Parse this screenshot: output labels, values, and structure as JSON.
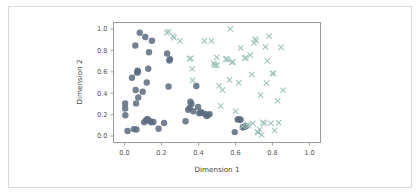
{
  "figure": {
    "background_color": "#ffffff",
    "border_color": "#d8d8d8",
    "axes_spine_color": "#9a9a9a"
  },
  "chart_data": {
    "type": "scatter",
    "title": "",
    "xlabel": "Dimension 1",
    "ylabel": "Dimension 2",
    "xlim": [
      -0.06,
      1.06
    ],
    "ylim": [
      -0.06,
      1.06
    ],
    "xticks": [
      0.0,
      0.2,
      0.4,
      0.6,
      0.8,
      1.0
    ],
    "yticks": [
      0.0,
      0.2,
      0.4,
      0.6,
      0.8,
      1.0
    ],
    "xtick_labels": [
      "0.0",
      "0.2",
      "0.4",
      "0.6",
      "0.8",
      "1.0"
    ],
    "ytick_labels": [
      "0.0",
      "0.2",
      "0.4",
      "0.6",
      "0.8",
      "1.0"
    ],
    "grid": false,
    "legend": false,
    "legend_position": "none",
    "series": [
      {
        "name": "cluster-circles",
        "marker": "o",
        "color": "#5b6b80",
        "marker_size": 4.2,
        "points": [
          [
            0.003,
            0.305
          ],
          [
            0.003,
            0.258
          ],
          [
            0.004,
            0.195
          ],
          [
            0.016,
            0.048
          ],
          [
            0.04,
            0.545
          ],
          [
            0.05,
            0.065
          ],
          [
            0.058,
            0.845
          ],
          [
            0.06,
            0.43
          ],
          [
            0.062,
            0.305
          ],
          [
            0.064,
            0.062
          ],
          [
            0.068,
            0.592
          ],
          [
            0.07,
            0.61
          ],
          [
            0.072,
            0.6
          ],
          [
            0.074,
            0.36
          ],
          [
            0.082,
            0.965
          ],
          [
            0.098,
            0.413
          ],
          [
            0.106,
            0.13
          ],
          [
            0.112,
            0.925
          ],
          [
            0.116,
            0.148
          ],
          [
            0.12,
            0.5
          ],
          [
            0.124,
            0.16
          ],
          [
            0.128,
            0.628
          ],
          [
            0.132,
            0.782
          ],
          [
            0.136,
            0.142
          ],
          [
            0.144,
            0.128
          ],
          [
            0.148,
            0.89
          ],
          [
            0.156,
            0.132
          ],
          [
            0.184,
            0.068
          ],
          [
            0.214,
            0.122
          ],
          [
            0.23,
            0.77
          ],
          [
            0.238,
            0.462
          ],
          [
            0.242,
            0.705
          ],
          [
            0.246,
            0.718
          ],
          [
            0.33,
            0.138
          ],
          [
            0.344,
            0.245
          ],
          [
            0.352,
            0.262
          ],
          [
            0.356,
            0.32
          ],
          [
            0.362,
            0.3
          ],
          [
            0.372,
            0.232
          ],
          [
            0.388,
            0.468
          ],
          [
            0.398,
            0.272
          ],
          [
            0.404,
            0.212
          ],
          [
            0.412,
            0.222
          ],
          [
            0.418,
            0.218
          ],
          [
            0.436,
            0.206
          ],
          [
            0.444,
            0.188
          ],
          [
            0.452,
            0.196
          ],
          [
            0.46,
            0.205
          ],
          [
            0.596,
            0.037
          ],
          [
            0.612,
            0.155
          ],
          [
            0.62,
            0.157
          ],
          [
            0.628,
            0.152
          ],
          [
            0.64,
            0.08
          ],
          [
            0.648,
            0.088
          ],
          [
            0.656,
            0.092
          ]
        ]
      },
      {
        "name": "cluster-crosses",
        "marker": "x",
        "color": "#9fc4bd",
        "marker_size": 3.6,
        "points": [
          [
            0.228,
            0.965
          ],
          [
            0.238,
            0.975
          ],
          [
            0.262,
            0.932
          ],
          [
            0.268,
            0.918
          ],
          [
            0.3,
            0.888
          ],
          [
            0.352,
            0.72
          ],
          [
            0.358,
            0.726
          ],
          [
            0.366,
            0.628
          ],
          [
            0.368,
            0.52
          ],
          [
            0.432,
            0.888
          ],
          [
            0.47,
            0.888
          ],
          [
            0.482,
            0.678
          ],
          [
            0.486,
            0.66
          ],
          [
            0.492,
            0.668
          ],
          [
            0.498,
            0.735
          ],
          [
            0.5,
            0.66
          ],
          [
            0.512,
            0.47
          ],
          [
            0.52,
            0.282
          ],
          [
            0.53,
            0.43
          ],
          [
            0.548,
            0.718
          ],
          [
            0.552,
            0.722
          ],
          [
            0.56,
            0.712
          ],
          [
            0.568,
            0.524
          ],
          [
            0.572,
            1.0
          ],
          [
            0.58,
            0.688
          ],
          [
            0.586,
            0.692
          ],
          [
            0.6,
            0.232
          ],
          [
            0.618,
            0.498
          ],
          [
            0.628,
            0.822
          ],
          [
            0.638,
            0.092
          ],
          [
            0.65,
            0.726
          ],
          [
            0.656,
            0.732
          ],
          [
            0.664,
            0.108
          ],
          [
            0.672,
            0.098
          ],
          [
            0.68,
            0.755
          ],
          [
            0.688,
            0.575
          ],
          [
            0.694,
            0.118
          ],
          [
            0.7,
            0.868
          ],
          [
            0.706,
            0.905
          ],
          [
            0.712,
            0.888
          ],
          [
            0.718,
            0.04
          ],
          [
            0.722,
            0.032
          ],
          [
            0.73,
            0.062
          ],
          [
            0.736,
            0.382
          ],
          [
            0.742,
            0.012
          ],
          [
            0.748,
            0.128
          ],
          [
            0.756,
            0.118
          ],
          [
            0.762,
            0.832
          ],
          [
            0.768,
            0.495
          ],
          [
            0.772,
            0.702
          ],
          [
            0.782,
            0.932
          ],
          [
            0.792,
            0.12
          ],
          [
            0.8,
            0.585
          ],
          [
            0.806,
            0.585
          ],
          [
            0.812,
            0.052
          ],
          [
            0.828,
            0.33
          ],
          [
            0.834,
            0.126
          ],
          [
            0.846,
            0.828
          ],
          [
            0.858,
            0.428
          ]
        ]
      }
    ]
  },
  "axes": {
    "xlabel": "Dimension 1",
    "ylabel": "Dimension 2",
    "xtick_labels": [
      "0.0",
      "0.2",
      "0.4",
      "0.6",
      "0.8",
      "1.0"
    ],
    "ytick_labels": [
      "0.0",
      "0.2",
      "0.4",
      "0.6",
      "0.8",
      "1.0"
    ]
  }
}
